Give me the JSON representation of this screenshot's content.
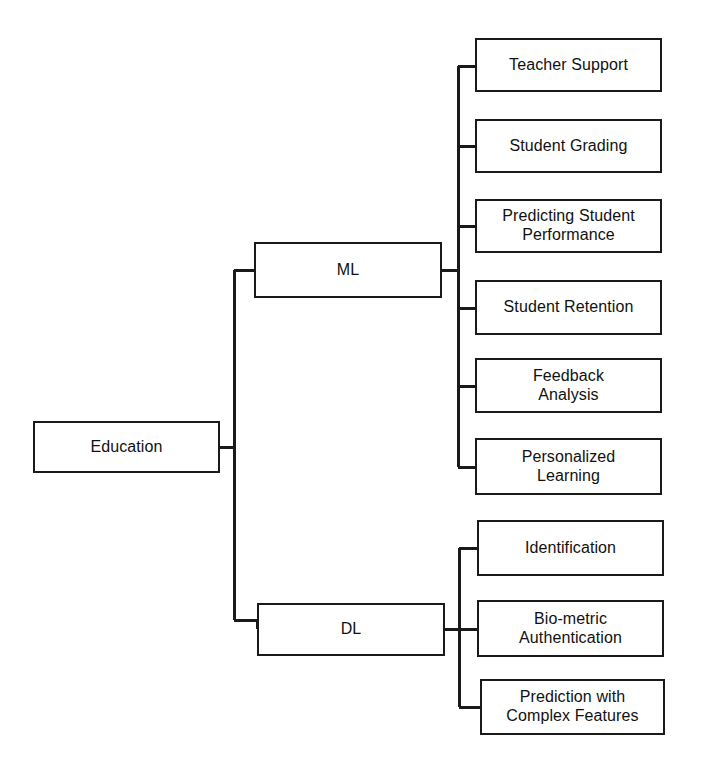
{
  "diagram": {
    "type": "tree-hierarchy",
    "orientation": "left-to-right",
    "background_color": "#ffffff",
    "line_color": "#1a1a1a",
    "box_border_color": "#1a1a1a",
    "box_fill_color": "#ffffff",
    "root": {
      "id": "education",
      "label": "Education",
      "x": 33,
      "y": 421,
      "w": 187,
      "h": 52
    },
    "branches": [
      {
        "id": "ml",
        "label": "ML",
        "x": 254,
        "y": 242,
        "w": 188,
        "h": 56,
        "children": [
          {
            "id": "teacher-support",
            "label": "Teacher Support",
            "x": 475,
            "y": 38,
            "w": 187,
            "h": 54
          },
          {
            "id": "student-grading",
            "label": "Student Grading",
            "x": 475,
            "y": 119,
            "w": 187,
            "h": 54
          },
          {
            "id": "predicting-student-performance",
            "label": "Predicting Student\nPerformance",
            "x": 475,
            "y": 199,
            "w": 187,
            "h": 54
          },
          {
            "id": "student-retention",
            "label": "Student Retention",
            "x": 475,
            "y": 280,
            "w": 187,
            "h": 55
          },
          {
            "id": "feedback-analysis",
            "label": "Feedback\nAnalysis",
            "x": 475,
            "y": 358,
            "w": 187,
            "h": 55
          },
          {
            "id": "personalized-learning",
            "label": "Personalized\nLearning",
            "x": 475,
            "y": 438,
            "w": 187,
            "h": 57
          }
        ]
      },
      {
        "id": "dl",
        "label": "DL",
        "x": 257,
        "y": 603,
        "w": 188,
        "h": 53,
        "children": [
          {
            "id": "identification",
            "label": "Identification",
            "x": 477,
            "y": 520,
            "w": 187,
            "h": 56
          },
          {
            "id": "bio-metric-authentication",
            "label": "Bio-metric\nAuthentication",
            "x": 477,
            "y": 600,
            "w": 187,
            "h": 57
          },
          {
            "id": "prediction-with-complex-features",
            "label": "Prediction with\nComplex Features",
            "x": 480,
            "y": 679,
            "w": 185,
            "h": 56
          }
        ]
      }
    ],
    "edges": {
      "root_trunk_x": 234,
      "root_trunk_top": 270,
      "root_trunk_bottom": 620,
      "root_stub_y": 447,
      "ml_trunk_x": 458,
      "ml_trunk_top": 66,
      "ml_trunk_bottom": 467,
      "ml_stub_y": 270,
      "dl_trunk_x": 459,
      "dl_trunk_top": 548,
      "dl_trunk_bottom": 707,
      "dl_stub_y": 629
    }
  }
}
